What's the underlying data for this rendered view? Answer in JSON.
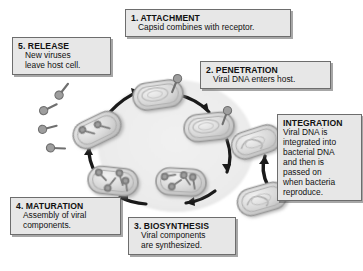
{
  "figure": {
    "colors": {
      "box_fill": "#e7e7e7",
      "box_border": "#6d6d6d",
      "text": "#111111",
      "cycle_field": "#ededed",
      "cell_body": "#cfcfcf",
      "cell_outline": "#9a9a9a",
      "arrow": "#1a1a1a",
      "virus": "#8e8e8e",
      "page_background": "#ffffff"
    }
  },
  "callouts": [
    {
      "id": "attachment",
      "heading": "1. ATTACHMENT",
      "lines": [
        "Capsid combines with receptor."
      ]
    },
    {
      "id": "penetration",
      "heading": "2. PENETRATION",
      "lines": [
        "Viral DNA enters host."
      ]
    },
    {
      "id": "biosynthesis",
      "heading": "3. BIOSYNTHESIS",
      "lines": [
        "Viral components",
        "are synthesized."
      ]
    },
    {
      "id": "maturation",
      "heading": "4. MATURATION",
      "lines": [
        "Assembly of viral",
        "components."
      ]
    },
    {
      "id": "release",
      "heading": "5. RELEASE",
      "lines": [
        "New viruses",
        "leave host cell."
      ]
    },
    {
      "id": "integration",
      "heading": "INTEGRATION",
      "lines": [
        "Viral DNA is",
        "integrated into",
        "bacterial DNA",
        "and then is",
        "passed on",
        "when bacteria",
        "reproduce."
      ]
    }
  ],
  "diagram": {
    "cycle_stages": [
      {
        "name": "attachment-cell",
        "cx": 148,
        "cy": 101,
        "rotation": -8
      },
      {
        "name": "penetration-cell",
        "cx": 205,
        "cy": 124,
        "rotation": -6
      },
      {
        "name": "integration-cell-upper",
        "cx": 248,
        "cy": 140,
        "rotation": -18
      },
      {
        "name": "integration-cell-lower",
        "cx": 256,
        "cy": 196,
        "rotation": -16
      },
      {
        "name": "biosynthesis-cell",
        "cx": 180,
        "cy": 181,
        "rotation": 4
      },
      {
        "name": "maturation-cell",
        "cx": 113,
        "cy": 180,
        "rotation": 6
      },
      {
        "name": "release-cell",
        "cx": 95,
        "cy": 128,
        "rotation": -26
      }
    ],
    "free_viruses": 4,
    "attached_viruses": 2
  }
}
